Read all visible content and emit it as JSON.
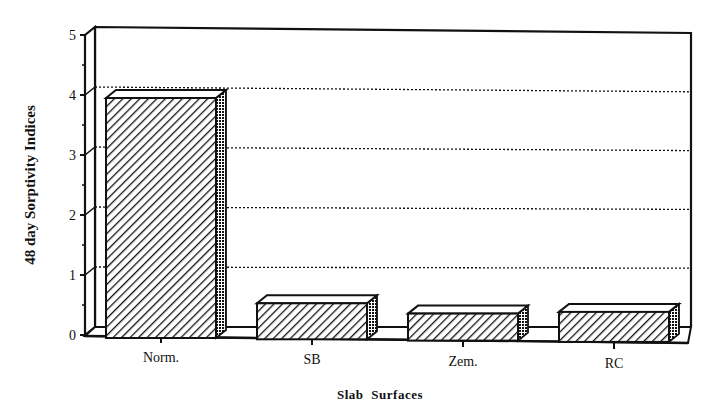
{
  "chart_data": {
    "type": "bar",
    "style": "3d",
    "title": "",
    "xlabel": "Slab Surfaces",
    "ylabel": "48 day Sorptivity Indices",
    "categories": [
      "Norm.",
      "SB",
      "Zem.",
      "RC"
    ],
    "values": [
      4.0,
      0.6,
      0.45,
      0.5
    ],
    "ylim": [
      0,
      5
    ],
    "yticks": [
      0,
      1,
      2,
      3,
      4,
      5
    ],
    "grid": true,
    "grid_style": "dotted",
    "legend": null,
    "fill_pattern": "diagonal-hatch",
    "colors": {
      "ink": "#111111",
      "background": "#ffffff"
    }
  }
}
